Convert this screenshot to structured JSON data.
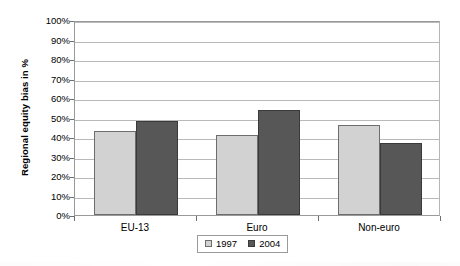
{
  "chart_data": {
    "type": "bar",
    "title": "",
    "xlabel": "",
    "ylabel": "Regional equity bias in %",
    "categories": [
      "EU-13",
      "Euro",
      "Non-euro"
    ],
    "series": [
      {
        "name": "1997",
        "values": [
          43,
          41,
          46
        ],
        "color": "#d2d2d2"
      },
      {
        "name": "2004",
        "values": [
          48,
          54,
          37
        ],
        "color": "#575757"
      }
    ],
    "ylim": [
      0,
      100
    ],
    "ytick_labels": [
      "0%",
      "10%",
      "20%",
      "30%",
      "40%",
      "50%",
      "60%",
      "70%",
      "80%",
      "90%",
      "100%"
    ],
    "ytick_values": [
      0,
      10,
      20,
      30,
      40,
      50,
      60,
      70,
      80,
      90,
      100
    ],
    "grid": true,
    "legend_position": "bottom-center",
    "legend_entries": [
      "1997",
      "2004"
    ],
    "value_suffix": "%"
  }
}
